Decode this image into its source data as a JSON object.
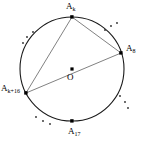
{
  "figure": {
    "type": "circle-geometry-diagram",
    "colors": {
      "stroke": "#1a1a1a",
      "chord": "#5a5a5a",
      "point": "#000000",
      "background": "#ffffff"
    },
    "circle": {
      "center_x": 72,
      "center_y": 69,
      "radius": 52
    },
    "center_point": {
      "label": "O",
      "x": 72,
      "y": 69
    },
    "vertices": [
      {
        "id": "top",
        "label_main": "A",
        "label_sub": "k",
        "x": 72,
        "y": 17
      },
      {
        "id": "right",
        "label_main": "A",
        "label_sub": "8",
        "x": 121,
        "y": 53
      },
      {
        "id": "left",
        "label_main": "A",
        "label_sub": "k+16",
        "x": 26,
        "y": 93
      },
      {
        "id": "bottom",
        "label_main": "A",
        "label_sub": "17",
        "x": 72,
        "y": 121
      }
    ],
    "chords": [
      {
        "id": "chord-top-right",
        "from": "top",
        "to": "right"
      },
      {
        "id": "chord-top-left",
        "from": "top",
        "to": "left"
      },
      {
        "id": "chord-left-right",
        "from": "left",
        "to": "right"
      }
    ],
    "ellipses": [
      {
        "id": "ellipsis-upper-right",
        "dots": 3
      },
      {
        "id": "ellipsis-upper-left",
        "dots": 3
      },
      {
        "id": "ellipsis-lower-left",
        "dots": 3
      },
      {
        "id": "ellipsis-lower-right",
        "dots": 3
      }
    ]
  }
}
